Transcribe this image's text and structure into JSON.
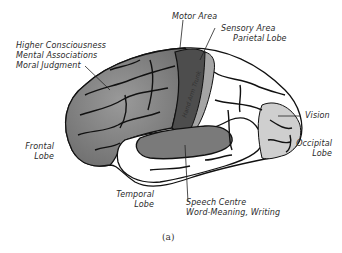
{
  "diagram": {
    "type": "brain-lateral-view",
    "caption": "(a)",
    "labels": {
      "motor_area": "Motor Area",
      "sensory_area_line1": "Sensory Area",
      "sensory_area_line2": "Parietal Lobe",
      "higher_line1": "Higher Consciousness",
      "higher_line2": "Mental Associations",
      "higher_line3": "Moral Judgment",
      "frontal_line1": "Frontal",
      "frontal_line2": "Lobe",
      "vision": "Vision",
      "occipital_line1": "Occipital",
      "occipital_line2": "Lobe",
      "temporal_line1": "Temporal",
      "temporal_line2": "Lobe",
      "speech_line1": "Speech Centre",
      "speech_line2": "Word-Meaning, Writing",
      "motor_strip_text": "Hand Arm Trunk"
    },
    "colors": {
      "frontal_shade": "#8a8a8a",
      "motor_shade": "#555555",
      "occipital_shade": "#c8c8c8",
      "speech_shade": "#7a7a7a",
      "outline": "#111111"
    }
  }
}
